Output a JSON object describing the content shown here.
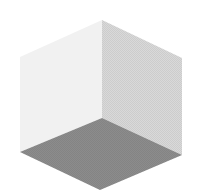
{
  "diagram": {
    "type": "isometric-room-corner",
    "colors": {
      "background": "#ffffff",
      "left_wall": "#f1f1f1",
      "right_wall": "#d9d9d9",
      "floor": "#8c8c8c"
    },
    "faces": [
      {
        "name": "left-wall",
        "points": "20,57 102,20 102,118 20,152"
      },
      {
        "name": "right-wall",
        "points": "102,20 182,58 182,155 102,118"
      },
      {
        "name": "floor",
        "points": "102,118 182,155 100,190 20,152"
      }
    ]
  }
}
